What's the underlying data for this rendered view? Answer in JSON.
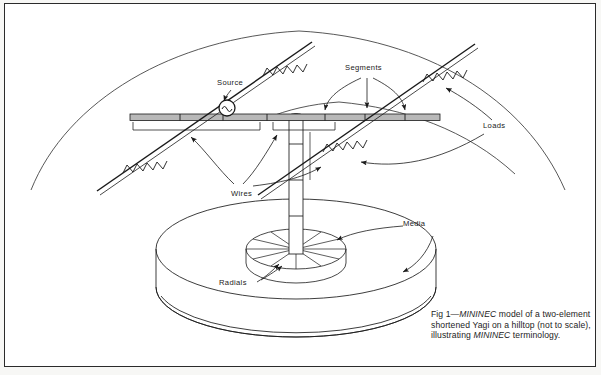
{
  "figure": {
    "background_color": "#ffffff",
    "frame_color": "#2b2b2b",
    "ink_color": "#1a1a1a",
    "boom_fill": "#b8b8b8",
    "caption": {
      "prefix": "Fig 1—",
      "italic_1": "MININEC",
      "text_1": " model of a two-element shortened Yagi on a hilltop (not to scale), illustrating ",
      "italic_2": "MININEC",
      "text_2": " terminology."
    },
    "labels": [
      {
        "id": "source",
        "text": "Source",
        "x": 212,
        "y": 81
      },
      {
        "id": "segments",
        "text": "Segments",
        "x": 353,
        "y": 66
      },
      {
        "id": "loads",
        "text": "Loads",
        "x": 487,
        "y": 124
      },
      {
        "id": "wires",
        "text": "Wires",
        "x": 232,
        "y": 185
      },
      {
        "id": "media",
        "text": "Media",
        "x": 403,
        "y": 225
      },
      {
        "id": "radials",
        "text": "Radials",
        "x": 221,
        "y": 281
      }
    ],
    "components": {
      "source_symbol": "ac-source-circle",
      "load_symbol": "helical-coil-inductor",
      "ground_symbol": "media-disk",
      "radials_symbol": "radial-spoke-disk",
      "mast_symbol": "vertical-tube-mast",
      "boom_symbol": "segmented-boom",
      "hill_symbol": "hilltop-arc"
    },
    "counts": {
      "elements": 2,
      "loads": 4,
      "segment_arrows": 3,
      "radial_spokes": 12,
      "boom_segment_ticks": 6
    }
  }
}
